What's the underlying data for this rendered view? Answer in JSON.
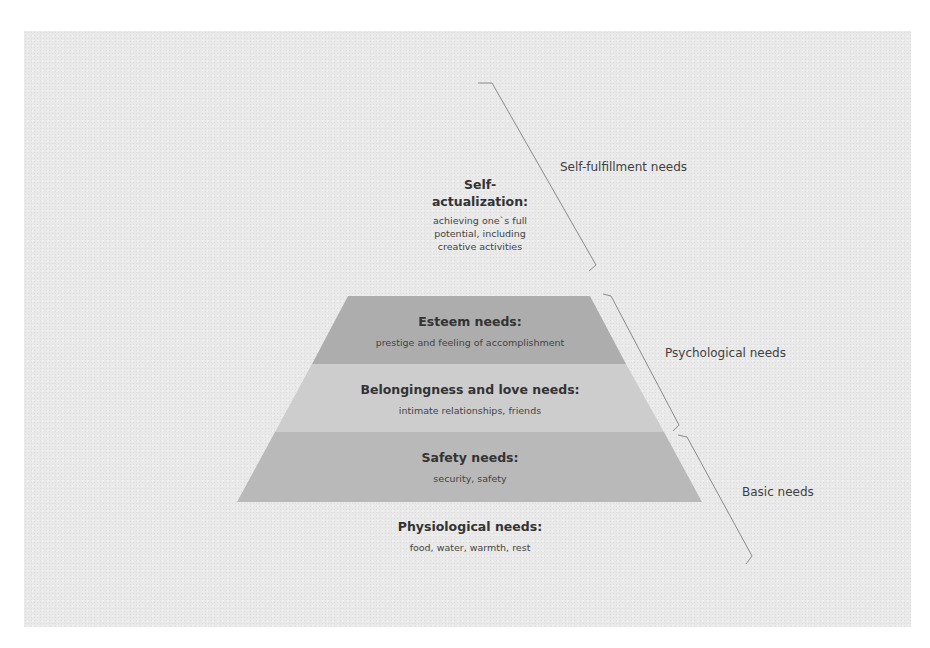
{
  "diagram": {
    "colors": {
      "background": "#e9e9e9",
      "esteem_fill": "#adadad",
      "belonging_fill": "#cdcdcd",
      "safety_fill": "#b9b9b9",
      "bracket_stroke": "#8a8a8a",
      "text": "#333333"
    },
    "levels": [
      {
        "id": "self-actualization",
        "title_line1": "Self-",
        "title_line2": "actualization:",
        "description_lines": [
          "achieving one`s full",
          "potential, including",
          "creative activities"
        ]
      },
      {
        "id": "esteem",
        "title": "Esteem needs:",
        "description": "prestige and feeling of accomplishment"
      },
      {
        "id": "belongingness",
        "title": "Belongingness and love needs:",
        "description": "intimate relationships, friends"
      },
      {
        "id": "safety",
        "title": "Safety needs:",
        "description": "security, safety"
      },
      {
        "id": "physiological",
        "title": "Physiological needs:",
        "description": "food, water, warmth, rest"
      }
    ],
    "groups": [
      {
        "id": "self-fulfillment",
        "label": "Self-fulfillment needs"
      },
      {
        "id": "psychological",
        "label": "Psychological needs"
      },
      {
        "id": "basic",
        "label": "Basic needs"
      }
    ]
  }
}
